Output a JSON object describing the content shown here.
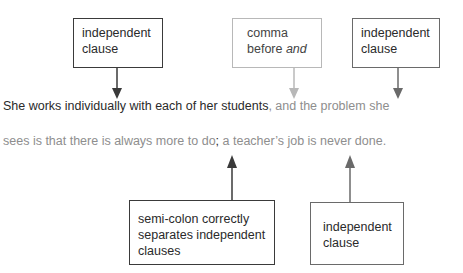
{
  "labels": {
    "top_left": {
      "line1": "independent",
      "line2": "clause"
    },
    "top_middle": {
      "line1": "comma",
      "line2_prefix": "before ",
      "line2_italic": "and"
    },
    "top_right": {
      "line1": "independent",
      "line2": "clause"
    },
    "bottom_left": {
      "line1": "semi-colon correctly",
      "line2": "separates independent",
      "line3": "clauses"
    },
    "bottom_right": {
      "line1": "independent",
      "line2": "clause"
    }
  },
  "sentence": {
    "line1_dark": "She works individually with each of her students",
    "line1_gray": ", and the problem she",
    "line2_gray_a": "sees is that there is always more to do",
    "line2_dark": ";",
    "line2_gray_b": " a teacher’s job is never done."
  },
  "colors": {
    "dark": "#2a2a2a",
    "gray_text": "#8e8e8e",
    "light_arrow": "#b8b8b8",
    "mid_arrow": "#6a6a6a"
  }
}
